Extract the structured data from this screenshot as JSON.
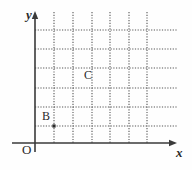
{
  "figure": {
    "type": "coordinate-grid-diagram",
    "background_color": "#fefefe",
    "axis_color": "#3a3a3a",
    "grid_color": "#555555",
    "label_color": "#2a2a2a"
  },
  "axes": {
    "y_axis_label": "y",
    "x_axis_label": "x",
    "origin_label": "O",
    "y_axis_x_px": 35,
    "x_axis_y_px": 143,
    "y_axis_top_px": 12,
    "x_axis_right_px": 176,
    "arrowheads": [
      "y-axis-up",
      "x-axis-right"
    ]
  },
  "grid": {
    "style": "dotted",
    "vertical_lines_x": [
      54,
      73,
      92,
      110,
      129,
      147
    ],
    "horizontal_lines_y": [
      30,
      49,
      68,
      88,
      107,
      126
    ],
    "vertical_line_top": 12,
    "vertical_line_bottom": 143,
    "horizontal_line_left": 35,
    "horizontal_line_right": 178,
    "cell_width": 19,
    "cell_height": 19,
    "columns": 6,
    "rows": 6
  },
  "points": [
    {
      "name": "B",
      "label": "B",
      "x_px": 54,
      "y_px": 126,
      "grid_x": 1,
      "grid_y": 1,
      "label_offset_x": -12,
      "label_offset_y": -16,
      "marker": "dot"
    },
    {
      "name": "C",
      "label": "C",
      "x_px": 92,
      "y_px": 78,
      "grid_x": 3,
      "grid_y": 3.5,
      "label_offset_x": -8,
      "label_offset_y": -9,
      "marker": "none"
    }
  ],
  "chart_data": {
    "type": "scatter",
    "title": "",
    "xlabel": "x",
    "ylabel": "y",
    "grid": true,
    "legend": "none",
    "xlim": [
      0,
      7.4
    ],
    "ylim": [
      0,
      6.9
    ],
    "categories": [
      "B",
      "C"
    ],
    "points": [
      {
        "label": "B",
        "x": 1,
        "y": 1
      },
      {
        "label": "C",
        "x": 3,
        "y": 3.5
      }
    ]
  }
}
